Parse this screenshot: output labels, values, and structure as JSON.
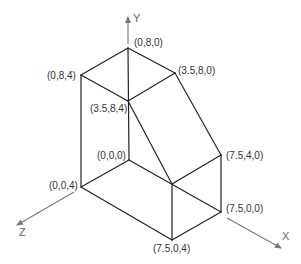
{
  "diagram": {
    "type": "isometric-3d-solid",
    "axes": {
      "x": {
        "label": "X"
      },
      "y": {
        "label": "Y"
      },
      "z": {
        "label": "Z"
      }
    },
    "vertices": {
      "v080": {
        "label": "(0,8,0)"
      },
      "v084": {
        "label": "(0,8,4)"
      },
      "v3580": {
        "label": "(3.5,8,0)"
      },
      "v3584": {
        "label": "(3.5,8,4)"
      },
      "v000": {
        "label": "(0,0,0)"
      },
      "v004": {
        "label": "(0,0,4)"
      },
      "v7540": {
        "label": "(7.5,4,0)"
      },
      "v7500": {
        "label": "(7.5,0,0)"
      },
      "v7504": {
        "label": "(7.5,0,4)"
      }
    },
    "colors": {
      "edge": "#222222",
      "axis": "#777777",
      "label": "#333333"
    }
  }
}
